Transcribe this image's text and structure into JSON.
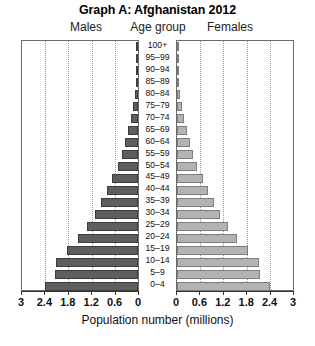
{
  "title": "Graph A: Afghanistan 2012",
  "headers": {
    "males": "Males",
    "age_group": "Age group",
    "females": "Females"
  },
  "axis": {
    "xlabel": "Population number (millions)",
    "tick_labels_left": [
      "3",
      "2.4",
      "1.8",
      "1.2",
      "0.6",
      "0"
    ],
    "tick_labels_right": [
      "0",
      "0.6",
      "1.2",
      "1.8",
      "2.4",
      "3"
    ]
  },
  "colors": {
    "male_bar": "#5e5e5e",
    "female_bar": "#b3b3b3",
    "male_bar_border": "#3d3d3d",
    "female_bar_border": "#7d7d7d",
    "axis": "#333333",
    "gridline": "#9a9a9a",
    "plot_border": "#6b6b6b"
  },
  "chart_data": {
    "type": "bar",
    "subtype": "population-pyramid",
    "title": "Graph A: Afghanistan 2012",
    "xlabel": "Population number (millions)",
    "ylabel": "Age group",
    "xlim": [
      0,
      3
    ],
    "xticks": [
      0,
      0.6,
      1.2,
      1.8,
      2.4,
      3
    ],
    "grid": true,
    "legend_position": "top",
    "orientation": "horizontal",
    "categories": [
      "100+",
      "95–99",
      "90–94",
      "85–89",
      "80–84",
      "75–79",
      "70–74",
      "65–69",
      "60–64",
      "55–59",
      "50–54",
      "45–49",
      "40–44",
      "35–39",
      "30–34",
      "25–29",
      "20–24",
      "15–19",
      "10–14",
      "5–9",
      "0–4"
    ],
    "series": [
      {
        "name": "Males",
        "side": "left",
        "values": [
          0.01,
          0.02,
          0.03,
          0.05,
          0.08,
          0.12,
          0.18,
          0.25,
          0.33,
          0.42,
          0.53,
          0.66,
          0.8,
          0.95,
          1.12,
          1.32,
          1.56,
          1.84,
          2.12,
          2.15,
          2.41
        ]
      },
      {
        "name": "Females",
        "side": "right",
        "values": [
          0.01,
          0.02,
          0.03,
          0.05,
          0.08,
          0.12,
          0.18,
          0.25,
          0.33,
          0.42,
          0.53,
          0.66,
          0.8,
          0.95,
          1.12,
          1.32,
          1.56,
          1.84,
          2.12,
          2.15,
          2.41
        ]
      }
    ]
  }
}
